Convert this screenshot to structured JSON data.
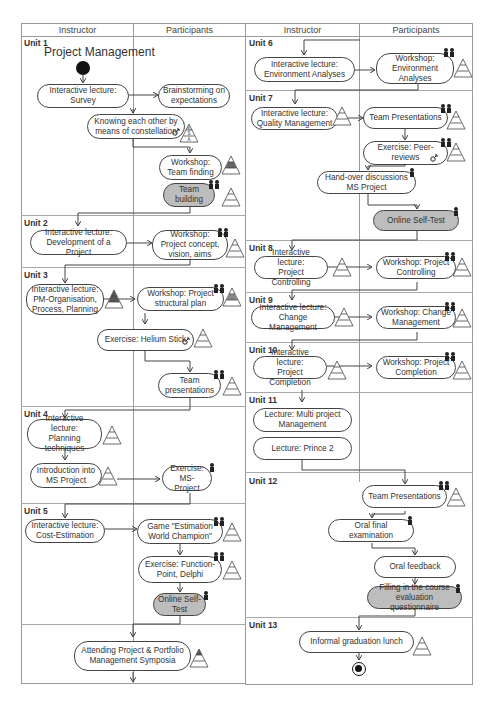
{
  "headers": {
    "left": {
      "instructor": "Instructor",
      "participants": "Participants"
    },
    "right": {
      "instructor": "Instructor",
      "participants": "Participants"
    }
  },
  "title": "Project Management",
  "units": {
    "u1": "Unit 1",
    "u2": "Unit 2",
    "u3": "Unit 3",
    "u4": "Unit 4",
    "u5": "Unit 5",
    "u6": "Unit 6",
    "u7": "Unit 7",
    "u8": "Unit 8",
    "u9": "Unit 9",
    "u10": "Unit 10",
    "u11": "Unit 11",
    "u12": "Unit 12",
    "u13": "Unit 13"
  },
  "nodes": {
    "n1": "Interactive lecture:\nSurvey",
    "n2": "Brainstorming on\nexpectations",
    "n3": "Knowing each other by\nmeans of constellation",
    "n4": "Workshop:\nTeam finding",
    "n5": "Team\nbuilding",
    "n6": "Interactive lecture:\nDevelopment of a Project",
    "n7": "Workshop:\nProject concept,\nvision, aims",
    "n8": "Interactive lecture:\nPM-Organisation,\nProcess, Planning",
    "n9": "Workshop: Project\nstructural plan",
    "n10": "Exercise: Helium Stick",
    "n11": "Team\npresentations",
    "n12": "Interactive lecture:\nPlanning\ntechniques",
    "n13": "Introduction into\nMS Project",
    "n14": "Exercise:\nMS-Project",
    "n15": "Interactive lecture:\nCost-Estimation",
    "n16": "Game \"Estimation\nWorld Champion\"",
    "n17": "Exercise: Function-\nPoint, Delphi",
    "n18": "Online Self-\nTest",
    "n19": "Attending Project & Portfolio\nManagement Symposia",
    "n20": "Interactive lecture:\nEnvironment Analyses",
    "n21": "Workshop:\nEnvironment\nAnalyses",
    "n22": "Interactive lecture:\nQuality Management",
    "n23": "Team Presentations",
    "n24": "Exercise: Peer-\nreviews",
    "n25": "Hand-over discussions\nMS Project",
    "n26": "Online Self-Test",
    "n27": "Interactive lecture:\nProject Controlling",
    "n28": "Workshop: Project\nControlling",
    "n29": "Interactive lecture:\nChange Management",
    "n30": "Workshop: Change\nManagement",
    "n31": "Interactive lecture:\nProject Completion",
    "n32": "Workshop: Project\nCompletion",
    "n33": "Lecture: Multi project\nManagement",
    "n34": "Lecture: Prince 2",
    "n35": "Team Presentations",
    "n36": "Oral final\nexamination",
    "n37": "Oral feedback",
    "n38": "Filling in the course\nevaluation questionnaire",
    "n39": "Informal graduation lunch"
  },
  "pyramid": {
    "top": "K",
    "mid": "S",
    "bottom": "A"
  },
  "colors": {
    "line": "#444444",
    "grey_node": "#bdbdbd",
    "grid": "#9a9a9a"
  }
}
